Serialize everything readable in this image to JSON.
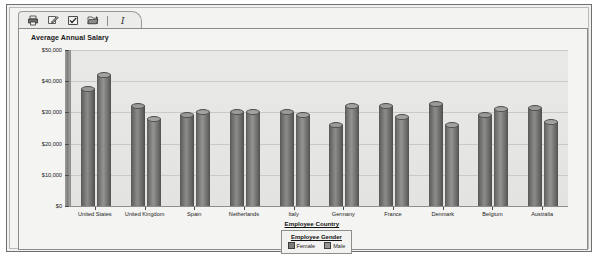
{
  "toolbar": {
    "buttons": [
      {
        "name": "print-icon",
        "label": "Print"
      },
      {
        "name": "edit-icon",
        "label": "Edit"
      },
      {
        "name": "check-box-icon",
        "label": "Select"
      },
      {
        "name": "open-folder-icon",
        "label": "Open"
      },
      {
        "name": "italic-icon",
        "label": "I"
      }
    ]
  },
  "chart_data": {
    "type": "bar",
    "title": "Average Annual Salary",
    "xlabel": "Employee Country",
    "ylabel": "",
    "ylim": [
      0,
      50000
    ],
    "yticks": [
      0,
      10000,
      20000,
      30000,
      40000,
      50000
    ],
    "ytick_labels": [
      "$0",
      "$10,000",
      "$20,000",
      "$30,000",
      "$40,000",
      "$50,000"
    ],
    "grid": true,
    "legend_title": "Employee Gender",
    "legend_position": "bottom",
    "categories": [
      "United States",
      "United Kingdom",
      "Spain",
      "Netherlands",
      "Italy",
      "Germany",
      "France",
      "Denmark",
      "Belgium",
      "Australia"
    ],
    "series": [
      {
        "name": "Female",
        "color": "#7c7c7a",
        "values": [
          38500,
          33000,
          30000,
          31000,
          31000,
          27000,
          33000,
          33500,
          30000,
          32500
        ]
      },
      {
        "name": "Male",
        "color": "#949492",
        "values": [
          43000,
          29000,
          31000,
          31000,
          30000,
          33000,
          29500,
          27000,
          32000,
          28000
        ]
      }
    ]
  }
}
